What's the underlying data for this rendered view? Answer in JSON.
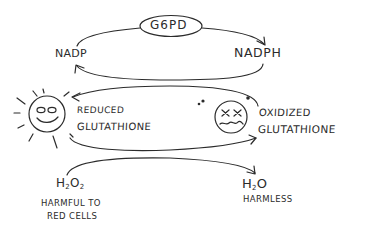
{
  "diagram": {
    "type": "hand-drawn biochemical cycle",
    "enzyme": {
      "label": "G6PD",
      "shape": "ellipse"
    },
    "cofactors": {
      "left": "NADP",
      "right": "NADPH"
    },
    "glutathione": {
      "reduced": {
        "line1": "REDUCED",
        "line2": "GLUTATHIONE",
        "icon": "smiling-sun-face-icon"
      },
      "oxidized": {
        "line1": "OXIDIZED",
        "line2": "GLUTATHIONE",
        "icon": "dizzy-sad-face-icon"
      }
    },
    "substrate": {
      "formula_main": "H",
      "formula_sub1": "2",
      "formula_mid": "O",
      "formula_sub2": "2",
      "note_line1": "HARMFUL TO",
      "note_line2": "RED CELLS"
    },
    "product": {
      "formula_main": "H",
      "formula_sub1": "2",
      "formula_end": "O",
      "note": "HARMLESS"
    },
    "arrows": [
      {
        "from": "NADP",
        "to": "NADPH",
        "via": "G6PD"
      },
      {
        "from": "NADPH",
        "to": "NADP"
      },
      {
        "from": "OXIDIZED GLUTATHIONE",
        "to": "REDUCED GLUTATHIONE"
      },
      {
        "from": "REDUCED GLUTATHIONE",
        "to": "OXIDIZED GLUTATHIONE"
      },
      {
        "from": "H2O2",
        "to": "H2O"
      }
    ],
    "colors": {
      "ink": "#2b2b2b",
      "background": "#ffffff"
    }
  }
}
